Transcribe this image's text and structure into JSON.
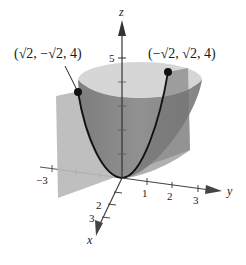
{
  "figure": {
    "colors": {
      "plane": "#b4b4b4",
      "paraboloid_outer": "#8a8a8a",
      "paraboloid_inner": "#c8c8c8",
      "paraboloid_rim": "#d9d9d9",
      "curve": "#111111",
      "axis": "#444444"
    },
    "axes": {
      "z": {
        "label": "z",
        "ticks": [
          {
            "value": "5",
            "label": "5"
          }
        ]
      },
      "y": {
        "label": "y",
        "ticks": [
          {
            "label": "1"
          },
          {
            "label": "2"
          },
          {
            "label": "3"
          }
        ]
      },
      "y_negative": {
        "ticks": [
          {
            "label": "−3"
          }
        ]
      },
      "x": {
        "label": "x",
        "ticks": [
          {
            "label": "2"
          },
          {
            "label": "3"
          }
        ]
      }
    },
    "points": [
      {
        "name": "left-point",
        "label": "(√2, −√2, 4)"
      },
      {
        "name": "right-point",
        "label": "(−√2, √2, 4)"
      }
    ]
  }
}
